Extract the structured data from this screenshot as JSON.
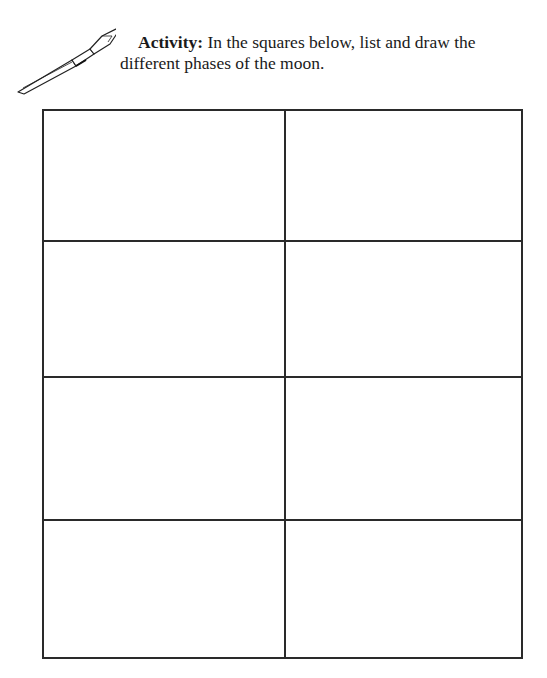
{
  "activity": {
    "label": "Activity:",
    "text": " In the squares below, list and draw the different phases of the moon."
  },
  "icons": {
    "pen": "fountain-pen-icon"
  },
  "grid": {
    "rows": 4,
    "columns": 2,
    "cells": [
      {
        "row": 1,
        "col": 1,
        "content": ""
      },
      {
        "row": 1,
        "col": 2,
        "content": ""
      },
      {
        "row": 2,
        "col": 1,
        "content": ""
      },
      {
        "row": 2,
        "col": 2,
        "content": ""
      },
      {
        "row": 3,
        "col": 1,
        "content": ""
      },
      {
        "row": 3,
        "col": 2,
        "content": ""
      },
      {
        "row": 4,
        "col": 1,
        "content": ""
      },
      {
        "row": 4,
        "col": 2,
        "content": ""
      }
    ]
  }
}
